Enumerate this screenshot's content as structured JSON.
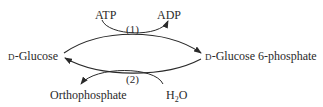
{
  "diagram": {
    "type": "substrate-cycle",
    "nodes": {
      "left": {
        "prefix": "D",
        "name": "-Glucose"
      },
      "right": {
        "prefix": "D",
        "name": "-Glucose 6-phosphate"
      }
    },
    "reactions": [
      {
        "id": "1",
        "label": "(1)",
        "direction": "left-to-right",
        "cosubstrate_in": "ATP",
        "cosubstrate_out": "ADP"
      },
      {
        "id": "2",
        "label": "(2)",
        "direction": "right-to-left",
        "cosubstrate_in_main": "H",
        "cosubstrate_in_sub": "2",
        "cosubstrate_in_tail": "O",
        "cosubstrate_out": "Orthophosphate"
      }
    ],
    "colors": {
      "ink": "#2a2a2a",
      "background": "#ffffff"
    }
  }
}
